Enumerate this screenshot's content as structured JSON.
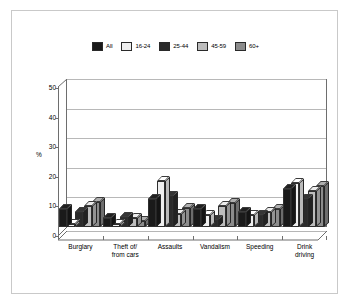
{
  "chart_data": {
    "type": "bar",
    "title": "",
    "subtitle": "",
    "xlabel": "",
    "ylabel": "%",
    "ylim": [
      0,
      50
    ],
    "yticks": [
      0,
      10,
      20,
      30,
      40,
      50
    ],
    "grid": true,
    "legend_position": "top-center",
    "style": "3d-grouped-column",
    "categories": [
      "Burglary",
      "Theft of/\nfrom cars",
      "Assaults",
      "Vandalism",
      "Speeding",
      "Drink\ndriving"
    ],
    "series": [
      {
        "name": "All",
        "color": "#1a1a1a",
        "values": [
          6,
          3,
          9.5,
          6,
          5,
          13
        ]
      },
      {
        "name": "16-24",
        "color": "#efefef",
        "values": [
          1,
          1,
          15.5,
          4,
          4,
          15
        ]
      },
      {
        "name": "25-44",
        "color": "#2b2b2b",
        "values": [
          5,
          3.5,
          10.5,
          2.5,
          4,
          9.5
        ]
      },
      {
        "name": "45-59",
        "color": "#bdbdbd",
        "values": [
          7,
          3,
          4.5,
          7,
          5,
          12
        ]
      },
      {
        "name": "60+",
        "color": "#8c8c8c",
        "values": [
          8.5,
          2,
          6.5,
          8,
          6,
          14
        ]
      }
    ]
  },
  "legend": {
    "items": [
      {
        "label": "All",
        "color": "#1a1a1a"
      },
      {
        "label": "16-24",
        "color": "#efefef"
      },
      {
        "label": "25-44",
        "color": "#2b2b2b"
      },
      {
        "label": "45-59",
        "color": "#bdbdbd"
      },
      {
        "label": "60+",
        "color": "#8c8c8c"
      }
    ]
  },
  "axis": {
    "y_label": "%",
    "y_tick_labels": [
      "50",
      "40",
      "30",
      "20",
      "10",
      "0"
    ]
  },
  "colors": {
    "frame_border": "#c9c9c9",
    "plot_border": "#6e6e6e",
    "gridline": "#b8b8b8",
    "background": "#ffffff"
  }
}
